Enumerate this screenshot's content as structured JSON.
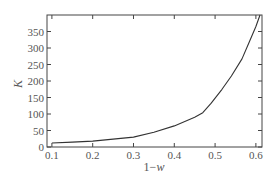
{
  "chart_data": {
    "type": "line",
    "title": "",
    "xlabel": "1−w",
    "xlabel_parts": {
      "prefix": "1−",
      "var": "w"
    },
    "ylabel": "K",
    "xlim": [
      0.088,
      0.615
    ],
    "ylim": [
      0,
      400
    ],
    "grid": false,
    "legend": null,
    "x_ticks": [
      0.1,
      0.2,
      0.3,
      0.4,
      0.5,
      0.6
    ],
    "x_tick_labels": [
      "0.1",
      "0.2",
      "0.3",
      "0.4",
      "0.5",
      "0.6"
    ],
    "y_ticks": [
      0,
      50,
      100,
      150,
      200,
      250,
      300,
      350
    ],
    "y_tick_labels": [
      "0",
      "50",
      "100",
      "150",
      "200",
      "250",
      "300",
      "350"
    ],
    "series": [
      {
        "name": "K",
        "color": "#333333",
        "x": [
          0.1,
          0.15,
          0.2,
          0.25,
          0.3,
          0.35,
          0.4,
          0.45,
          0.47,
          0.49,
          0.517,
          0.54,
          0.566,
          0.585,
          0.6,
          0.61
        ],
        "y": [
          12,
          15,
          18,
          24,
          30,
          45,
          64,
          90,
          104,
          132,
          175,
          215,
          267,
          322,
          365,
          400
        ]
      }
    ]
  },
  "style": {
    "axis_color": "#444444",
    "line_color": "#333333",
    "background": "#ffffff"
  }
}
